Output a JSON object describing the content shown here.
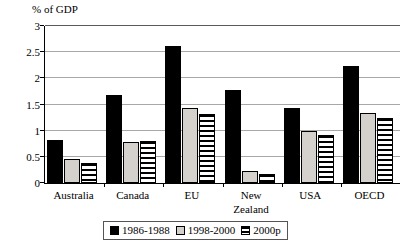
{
  "chart_data": {
    "type": "bar",
    "title": "",
    "ylabel": "% of GDP",
    "xlabel": "",
    "ylim": [
      0,
      3
    ],
    "yticks": [
      "0",
      "0.5",
      "1",
      "1.5",
      "2",
      "2.5",
      "3"
    ],
    "ytick_values": [
      0,
      0.5,
      1,
      1.5,
      2,
      2.5,
      3
    ],
    "grid": true,
    "legend_position": "bottom",
    "categories": [
      "Australia",
      "Canada",
      "EU",
      "New Zealand",
      "USA",
      "OECD"
    ],
    "category_label_lines": [
      [
        "Australia"
      ],
      [
        "Canada"
      ],
      [
        "EU"
      ],
      [
        "New",
        "Zealand"
      ],
      [
        "USA"
      ],
      [
        "OECD"
      ]
    ],
    "series": [
      {
        "name": "1986-1988",
        "color": "#000000",
        "pattern": "solid-black",
        "values": [
          0.82,
          1.68,
          2.62,
          1.77,
          1.44,
          2.24
        ]
      },
      {
        "name": "1998-2000",
        "color": "#d4d0cb",
        "pattern": "solid-light",
        "values": [
          0.45,
          0.78,
          1.44,
          0.23,
          0.99,
          1.34
        ]
      },
      {
        "name": "2000p",
        "color": "#ffffff",
        "pattern": "horizontal-stripes",
        "values": [
          0.39,
          0.81,
          1.31,
          0.18,
          0.92,
          1.25
        ]
      }
    ]
  },
  "legend": {
    "items": [
      {
        "label": "1986-1988",
        "swatch": "series-0"
      },
      {
        "label": "1998-2000",
        "swatch": "series-1"
      },
      {
        "label": "2000p",
        "swatch": "series-2"
      }
    ]
  }
}
